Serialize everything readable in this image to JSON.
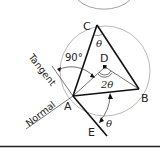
{
  "diagram": {
    "points": {
      "A": "A",
      "B": "B",
      "C": "C",
      "D": "D",
      "E": "E"
    },
    "lines": {
      "tangent": "Tangent",
      "normal": "Normal"
    },
    "angles": {
      "right_angle": "90°",
      "inscribed": "θ",
      "central": "2θ",
      "tangent_chord": "θ"
    },
    "colors": {
      "thick_line": "#111111",
      "thin_line": "#555555",
      "circle": "#999999"
    }
  }
}
